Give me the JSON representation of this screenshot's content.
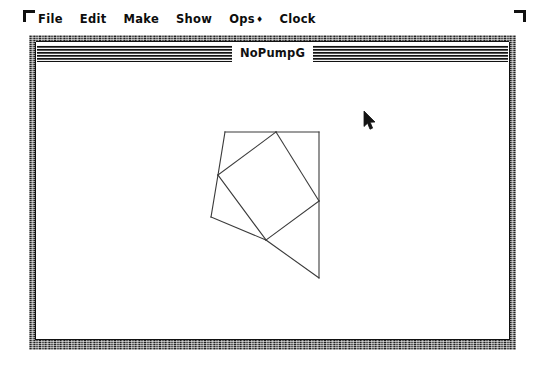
{
  "desktop": {
    "background_color": "#ffffff",
    "corner_marks": [
      "top-left-bracket",
      "top-right-bracket"
    ]
  },
  "menubar": {
    "items": [
      {
        "label": "File",
        "mark": ""
      },
      {
        "label": "Edit",
        "mark": ""
      },
      {
        "label": "Make",
        "mark": ""
      },
      {
        "label": "Show",
        "mark": ""
      },
      {
        "label": "Ops",
        "mark": "♦"
      },
      {
        "label": "Clock",
        "mark": ""
      }
    ]
  },
  "window": {
    "title": "NoPumpG",
    "frame_color": "#3a3a3a",
    "canvas_color": "#ffffff",
    "line_color": "#3b3b3b"
  },
  "cursor": {
    "type": "arrow-pointer",
    "x": 370,
    "y": 120
  },
  "chart_data": {
    "type": "diagram",
    "title": "",
    "stroke_color": "#3b3b3b",
    "stroke_width": 1.1,
    "viewbox": [
      0,
      0,
      471,
      275
    ],
    "points": {
      "A": [
        188,
        68
      ],
      "B": [
        239,
        68
      ],
      "C": [
        282,
        68
      ],
      "D": [
        181,
        111
      ],
      "E": [
        282,
        137
      ],
      "F": [
        174,
        153
      ],
      "G": [
        229,
        176
      ],
      "H": [
        282,
        214
      ]
    },
    "segments": [
      {
        "name": "top-edge-left",
        "from": "A",
        "to": "B"
      },
      {
        "name": "top-edge-right",
        "from": "B",
        "to": "C"
      },
      {
        "name": "right-edge-upper",
        "from": "C",
        "to": "E"
      },
      {
        "name": "right-edge-lower",
        "from": "E",
        "to": "H"
      },
      {
        "name": "left-edge-upper",
        "from": "A",
        "to": "D"
      },
      {
        "name": "left-edge-lower",
        "from": "D",
        "to": "F"
      },
      {
        "name": "bottom-edge-left",
        "from": "F",
        "to": "G"
      },
      {
        "name": "bottom-edge-right",
        "from": "G",
        "to": "H"
      },
      {
        "name": "inner-quad-top",
        "from": "D",
        "to": "B"
      },
      {
        "name": "inner-quad-right",
        "from": "B",
        "to": "E"
      },
      {
        "name": "inner-quad-bottom",
        "from": "E",
        "to": "G"
      },
      {
        "name": "inner-quad-left",
        "from": "G",
        "to": "D"
      }
    ]
  }
}
